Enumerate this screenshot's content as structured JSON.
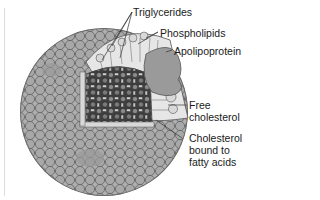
{
  "figure": {
    "colors": {
      "background": "#ffffff",
      "shell_fill": "#a9a9a9",
      "shell_stroke": "#555555",
      "core_dark": "#3a3a3a",
      "apolipoprotein_fill": "#9c9c9c",
      "label_text": "#1a1a1a",
      "leader_line": "#333333"
    },
    "labels": [
      {
        "id": "triglycerides",
        "text": "Triglycerides"
      },
      {
        "id": "phospholipids",
        "text": "Phospholipids"
      },
      {
        "id": "apolipoprotein",
        "text": "Apolipoprotein"
      },
      {
        "id": "free-cholesterol",
        "lines": [
          "Free",
          "cholesterol"
        ]
      },
      {
        "id": "cholesterol-esters",
        "lines": [
          "Cholesterol",
          "bound to",
          "fatty acids"
        ]
      }
    ]
  }
}
